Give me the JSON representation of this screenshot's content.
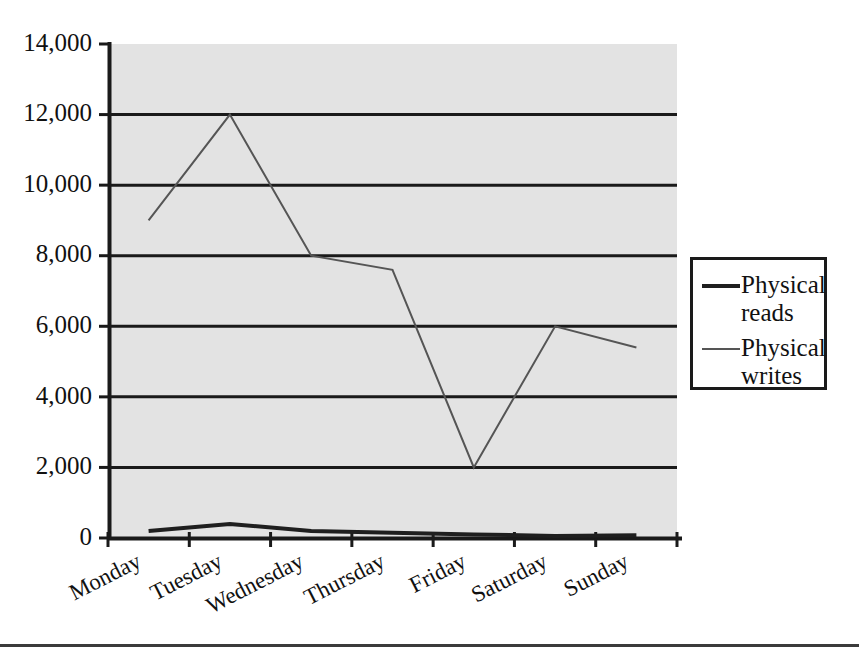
{
  "chart_data": {
    "type": "line",
    "title": "",
    "xlabel": "",
    "ylabel": "",
    "categories": [
      "Monday",
      "Tuesday",
      "Wednesday",
      "Thursday",
      "Friday",
      "Saturday",
      "Sunday"
    ],
    "ylim": [
      0,
      14000
    ],
    "ytick_values": [
      0,
      2000,
      4000,
      6000,
      8000,
      10000,
      12000,
      14000
    ],
    "ytick_labels": [
      "0",
      "2,000",
      "4,000",
      "6,000",
      "8,000",
      "10,000",
      "12,000",
      "14,000"
    ],
    "grid": true,
    "grid_axis": "y",
    "legend_position": "right",
    "plot_background": "#e3e3e3",
    "series": [
      {
        "name": "Physical reads",
        "color": "#1f1f1f",
        "line_width": 4,
        "values": [
          200,
          400,
          200,
          150,
          100,
          60,
          80
        ]
      },
      {
        "name": "Physical writes",
        "color": "#555555",
        "line_width": 2,
        "values": [
          9000,
          12000,
          8000,
          7600,
          2000,
          6000,
          5400
        ]
      }
    ]
  },
  "legend": {
    "entries": [
      {
        "label_line1": "Physical",
        "label_line2": "reads"
      },
      {
        "label_line1": "Physical",
        "label_line2": "writes"
      }
    ]
  },
  "colors": {
    "plot_fill": "#e3e3e3",
    "axis": "#1a1a1a",
    "gridline": "#1a1a1a",
    "page_background": "#ffffff",
    "rule": "#3b3b3b"
  }
}
